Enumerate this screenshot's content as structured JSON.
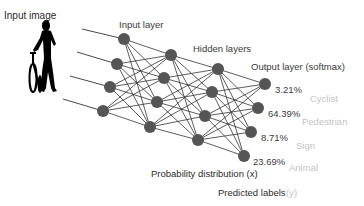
{
  "labels": {
    "input_image": "Input image",
    "input_layer": "Input layer",
    "hidden_layers": "Hidden layers",
    "output_layer": "Output layer (softmax)",
    "probability_distribution": "Probability distribution (x)",
    "predicted_labels": "Predicted labels",
    "predicted_labels_var": "(y)"
  },
  "outputs": [
    {
      "probability": "3.21%",
      "label": "Cyclist"
    },
    {
      "probability": "64.39%",
      "label": "Pedestrian"
    },
    {
      "probability": "8.71%",
      "label": "Sign"
    },
    {
      "probability": "23.69%",
      "label": "Animal"
    }
  ],
  "network": {
    "layers": [
      {
        "name": "input",
        "nodes": 4
      },
      {
        "name": "hidden-1",
        "nodes": 4
      },
      {
        "name": "hidden-2",
        "nodes": 4
      },
      {
        "name": "output",
        "nodes": 4
      }
    ],
    "connections": "fully-connected"
  },
  "input_icon": "person-with-bicycle-silhouette",
  "colors": {
    "node": "#555555",
    "edge": "#333333",
    "text": "#2b2b2b",
    "class_label": "#c4c4c4"
  }
}
